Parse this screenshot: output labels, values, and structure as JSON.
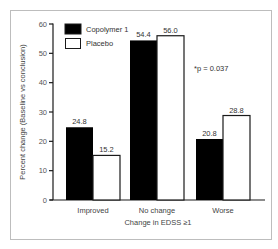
{
  "chart_data": {
    "type": "bar",
    "title": "",
    "xlabel": "Change in EDSS ≥1",
    "ylabel": "Percent change (Baseline vs conclusion)",
    "ylim": [
      0,
      60
    ],
    "yticks": [
      0,
      10,
      20,
      30,
      40,
      50,
      60
    ],
    "ytick_labels": [
      "0",
      "10",
      "20",
      "30",
      "40",
      "50",
      "60"
    ],
    "grid": false,
    "legend_position": "top-left",
    "categories": [
      "Improved",
      "No change",
      "Worse"
    ],
    "series": [
      {
        "name": "Copolymer 1",
        "color": "#000000",
        "values": [
          24.8,
          54.4,
          20.8
        ],
        "labels": [
          "24.8",
          "54.4",
          "20.8"
        ]
      },
      {
        "name": "Placebo",
        "color": "#ffffff",
        "values": [
          15.2,
          56.0,
          28.8
        ],
        "labels": [
          "15.2",
          "56.0",
          "28.8"
        ]
      }
    ],
    "annotations": [
      "*p = 0.037"
    ]
  }
}
